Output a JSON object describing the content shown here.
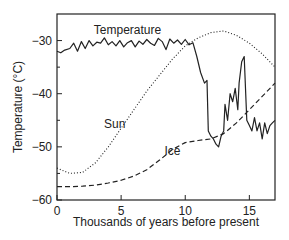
{
  "chart_data": {
    "type": "line",
    "title": "",
    "xlabel": "Thousands of years before present",
    "ylabel": "Temperature (°C)",
    "xlim": [
      0,
      17
    ],
    "ylim": [
      -60,
      -25
    ],
    "xticks": [
      0,
      5,
      10,
      15
    ],
    "yticks": [
      -30,
      -40,
      -50,
      -60
    ],
    "xtick_labels": [
      "0",
      "5",
      "10",
      "15"
    ],
    "ytick_labels": [
      "-30",
      "-40",
      "-50",
      "-60"
    ],
    "grid": false,
    "legend": "inline labels",
    "series": [
      {
        "name": "Temperature",
        "style": "solid",
        "x": [
          0,
          0.3,
          0.6,
          1.0,
          1.3,
          1.6,
          1.9,
          2.2,
          2.5,
          2.8,
          3.1,
          3.4,
          3.7,
          4.0,
          4.3,
          4.6,
          4.9,
          5.2,
          5.5,
          5.8,
          6.1,
          6.4,
          6.7,
          7.0,
          7.3,
          7.6,
          7.9,
          8.2,
          8.5,
          8.8,
          9.1,
          9.4,
          9.7,
          10.0,
          10.3,
          10.6,
          10.9,
          11.2,
          11.5,
          11.7,
          11.8,
          12.0,
          12.2,
          12.4,
          12.6,
          12.8,
          13.0,
          13.1,
          13.3,
          13.5,
          13.7,
          13.9,
          14.1,
          14.2,
          14.4,
          14.6,
          14.8,
          15.0,
          15.2,
          15.4,
          15.6,
          15.8,
          16.0,
          16.2,
          16.4,
          16.6,
          16.8,
          17.0
        ],
        "values": [
          -32.0,
          -32.3,
          -31.8,
          -31.5,
          -30.5,
          -32.0,
          -30.2,
          -31.5,
          -30.0,
          -31.0,
          -30.3,
          -30.5,
          -29.5,
          -30.8,
          -30.2,
          -31.0,
          -30.0,
          -31.2,
          -30.4,
          -30.0,
          -31.2,
          -30.1,
          -30.7,
          -29.8,
          -30.5,
          -30.9,
          -29.6,
          -30.2,
          -31.7,
          -29.7,
          -30.5,
          -29.9,
          -30.7,
          -29.8,
          -30.8,
          -30.4,
          -33.0,
          -36.0,
          -38.0,
          -37.5,
          -47.0,
          -48.0,
          -48.5,
          -49.5,
          -50.0,
          -48.0,
          -47.0,
          -42.0,
          -45.0,
          -40.0,
          -41.5,
          -39.0,
          -43.0,
          -38.0,
          -34.0,
          -33.0,
          -45.0,
          -46.0,
          -47.0,
          -44.5,
          -47.0,
          -45.5,
          -48.5,
          -45.5,
          -47.5,
          -46.0,
          -45.5,
          -45.0
        ]
      },
      {
        "name": "Sun",
        "style": "dotted",
        "x": [
          0,
          1,
          2,
          3,
          4,
          5,
          6,
          7,
          8,
          9,
          10,
          11,
          12,
          13,
          14,
          15,
          16,
          17
        ],
        "values": [
          -54.0,
          -55.0,
          -54.8,
          -53.0,
          -50.0,
          -46.5,
          -43.0,
          -39.5,
          -36.5,
          -33.5,
          -31.0,
          -29.5,
          -28.5,
          -28.2,
          -29.0,
          -30.5,
          -32.5,
          -35.0
        ]
      },
      {
        "name": "Ice",
        "style": "dashed",
        "x": [
          0,
          1,
          2,
          3,
          4,
          5,
          6,
          7,
          8,
          9,
          10,
          11,
          12,
          13,
          14,
          15,
          16,
          17
        ],
        "values": [
          -57.5,
          -57.5,
          -57.4,
          -57.2,
          -56.8,
          -56.3,
          -55.5,
          -54.3,
          -52.5,
          -50.5,
          -49.2,
          -48.8,
          -48.5,
          -47.5,
          -45.5,
          -43.0,
          -40.5,
          -38.0
        ]
      }
    ],
    "annotations": [
      {
        "text": "Temperature",
        "x": 5.5,
        "y": -28.7
      },
      {
        "text": "Sun",
        "x": 4.5,
        "y": -46.5
      },
      {
        "text": "Ice",
        "x": 9.0,
        "y": -51.5
      }
    ]
  }
}
